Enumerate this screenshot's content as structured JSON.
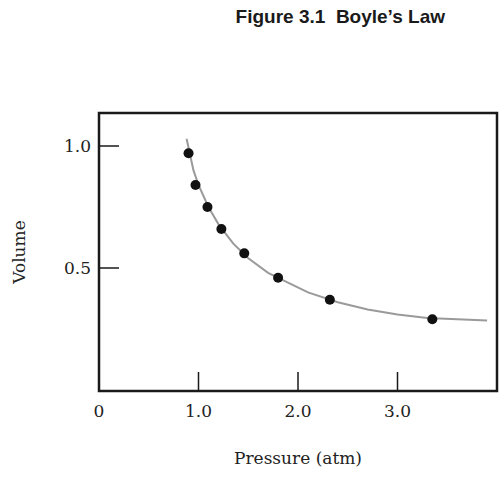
{
  "title": "Figure 3.1  Boyle’s Law",
  "colors": {
    "frame": "#1a1a1a",
    "curve": "#9a9a9a",
    "points": "#111111",
    "text": "#222222"
  },
  "chart_data": {
    "type": "scatter",
    "title": "Figure 3.1  Boyle’s Law",
    "xlabel": "Pressure (atm)",
    "ylabel": "Volume",
    "xlim": [
      0,
      4.0
    ],
    "ylim": [
      0,
      1.14
    ],
    "x_ticks": [
      {
        "value": 0,
        "label": "0"
      },
      {
        "value": 1.0,
        "label": "1.0"
      },
      {
        "value": 2.0,
        "label": "2.0"
      },
      {
        "value": 3.0,
        "label": "3.0"
      }
    ],
    "y_ticks": [
      {
        "value": 1.0,
        "label": "1.0"
      },
      {
        "value": 0.5,
        "label": "0.5"
      }
    ],
    "grid": false,
    "legend": null,
    "series": [
      {
        "name": "Measured",
        "style": "markers",
        "x": [
          0.9,
          0.97,
          1.09,
          1.23,
          1.46,
          1.8,
          2.32,
          3.35
        ],
        "y": [
          0.97,
          0.84,
          0.75,
          0.66,
          0.56,
          0.46,
          0.37,
          0.29
        ]
      },
      {
        "name": "Fitted curve",
        "style": "line",
        "x": [
          0.88,
          0.95,
          1.0,
          1.1,
          1.2,
          1.35,
          1.5,
          1.7,
          1.9,
          2.1,
          2.4,
          2.7,
          3.0,
          3.3,
          3.6,
          3.9
        ],
        "y": [
          1.03,
          0.9,
          0.84,
          0.75,
          0.68,
          0.6,
          0.54,
          0.48,
          0.44,
          0.4,
          0.36,
          0.33,
          0.31,
          0.295,
          0.29,
          0.285
        ]
      }
    ]
  }
}
